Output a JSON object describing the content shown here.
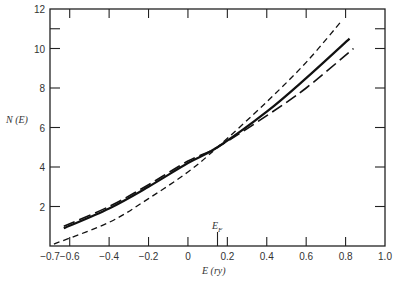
{
  "chart_data": {
    "type": "line",
    "title": "",
    "xlabel": "E (ry)",
    "ylabel": "N (E)",
    "xlim": [
      -0.7,
      1.0
    ],
    "ylim": [
      0,
      12
    ],
    "grid": false,
    "legend": null,
    "x_ticks": [
      "-0.7",
      "-0.6",
      "-0.4",
      "-0.2",
      "0",
      "0.2",
      "0.4",
      "0.6",
      "0.8",
      "1.0"
    ],
    "x_tick_values": [
      -0.7,
      -0.6,
      -0.4,
      -0.2,
      0,
      0.2,
      0.4,
      0.6,
      0.8,
      1.0
    ],
    "y_ticks": [
      "2",
      "4",
      "6",
      "8",
      "10",
      "12"
    ],
    "y_tick_values": [
      2,
      4,
      6,
      8,
      10,
      12
    ],
    "annotations": [
      {
        "text": "E_F",
        "x": 0.15,
        "y": 0
      }
    ],
    "series": [
      {
        "name": "solid",
        "style": "solid",
        "x": [
          -0.63,
          -0.4,
          -0.2,
          0.0,
          0.15,
          0.4,
          0.6,
          0.82
        ],
        "y": [
          0.9,
          1.9,
          3.0,
          4.2,
          5.0,
          6.8,
          8.5,
          10.5
        ]
      },
      {
        "name": "long-dash",
        "style": "long-dash",
        "x": [
          -0.63,
          -0.4,
          -0.2,
          0.0,
          0.15,
          0.4,
          0.6,
          0.84
        ],
        "y": [
          1.0,
          2.0,
          3.1,
          4.3,
          5.0,
          6.6,
          8.0,
          10.0
        ]
      },
      {
        "name": "short-dash",
        "style": "short-dash",
        "x": [
          -0.68,
          -0.4,
          -0.2,
          0.0,
          0.15,
          0.4,
          0.6,
          0.78
        ],
        "y": [
          0.1,
          1.2,
          2.4,
          3.75,
          5.0,
          7.3,
          9.3,
          11.4
        ]
      }
    ]
  },
  "labels": {
    "ylabel": "N (E)",
    "xlabel": "E (ry)",
    "ef": "E",
    "ef_sub": "F"
  }
}
